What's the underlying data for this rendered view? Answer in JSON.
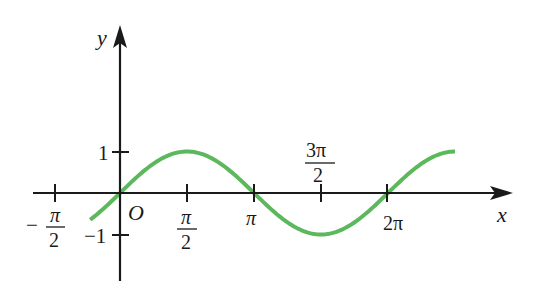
{
  "chart_data": {
    "type": "line",
    "title": "",
    "function": "y = sin x",
    "xlabel": "x",
    "ylabel": "y",
    "origin_label": "O",
    "grid": false,
    "legend": null,
    "xlim": [
      -1.8,
      8.95
    ],
    "ylim": [
      -2.1,
      4.0
    ],
    "x_domain": [
      -0.7,
      7.854
    ],
    "x_ticks": [
      {
        "value": -1.5708,
        "label_num": "π",
        "label_den": "2",
        "sign": "−"
      },
      {
        "value": 1.5708,
        "label_num": "π",
        "label_den": "2",
        "sign": ""
      },
      {
        "value": 3.1416,
        "label": "π"
      },
      {
        "value": 4.7124,
        "label_num": "3π",
        "label_den": "2",
        "sign": ""
      },
      {
        "value": 6.2832,
        "label": "2π"
      }
    ],
    "y_ticks": [
      {
        "value": 1,
        "label": "1"
      },
      {
        "value": -1,
        "label": "−1"
      }
    ],
    "series": [
      {
        "name": "sin x",
        "color": "#5cb85c",
        "x": [
          -0.7,
          0,
          0.7854,
          1.5708,
          2.3562,
          3.1416,
          3.927,
          4.7124,
          5.4978,
          6.2832,
          7.0686,
          7.854
        ],
        "y": [
          -0.644,
          0,
          0.707,
          1,
          0.707,
          0,
          -0.707,
          -1,
          -0.707,
          0,
          0.707,
          1
        ]
      }
    ]
  },
  "colors": {
    "axis": "#1a1a1a",
    "curve": "#5cb85c",
    "background": "#ffffff"
  },
  "labels": {
    "x_axis": "x",
    "y_axis": "y",
    "origin": "O",
    "neg_half_pi_sign": "−",
    "neg_half_pi_num": "π",
    "neg_half_pi_den": "2",
    "half_pi_num": "π",
    "half_pi_den": "2",
    "pi": "π",
    "three_half_pi_num": "3π",
    "three_half_pi_den": "2",
    "two_pi": "2π",
    "y_one": "1",
    "y_neg_one": "−1"
  }
}
